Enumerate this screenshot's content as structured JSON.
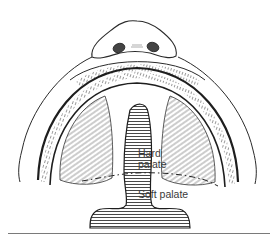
{
  "figure": {
    "line_color": "#2a2a2a",
    "hatch_color": "#333333",
    "background": "#ffffff"
  },
  "labels": {
    "hard_palate_line1": "Hard",
    "hard_palate_line2": "palate",
    "soft_palate": "Soft palate"
  },
  "icons": {
    "nose": "nose-illustration",
    "cleft": "cleft-illustration",
    "boundary": "dash-dot-boundary-line"
  }
}
